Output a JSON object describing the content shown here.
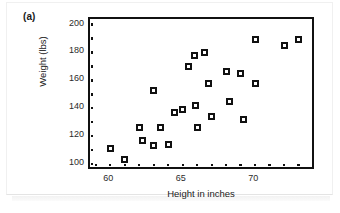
{
  "figure": {
    "panel_label": "(a)",
    "background_color": "#ffffff",
    "frame_color": "#111111",
    "marker_fill_color": "#ffffff",
    "marker_edge_color": "#111111"
  },
  "chart_data": {
    "type": "scatter",
    "title": "",
    "xlabel": "Height in inches",
    "ylabel": "Weight (lbs)",
    "xlim": [
      58.6,
      74.2
    ],
    "ylim": [
      95,
      204
    ],
    "xticks": [
      60,
      65,
      70
    ],
    "xtick_labels": [
      "60",
      "65",
      "70"
    ],
    "yticks": [
      100,
      120,
      140,
      160,
      180,
      200
    ],
    "ytick_labels": [
      "100",
      "120",
      "140",
      "160",
      "180",
      "200"
    ],
    "xminor_ticks": [
      59,
      60,
      61,
      62,
      63,
      64,
      65,
      66,
      67,
      68,
      69,
      70,
      71,
      72,
      73
    ],
    "yminor_ticks": [
      100,
      110,
      120,
      130,
      140,
      150,
      160,
      170,
      180,
      190,
      200
    ],
    "grid": false,
    "legend": null,
    "series": [
      {
        "name": "height-weight observations",
        "marker": "open-square",
        "points": [
          {
            "x": 60.0,
            "y": 111
          },
          {
            "x": 61.0,
            "y": 103
          },
          {
            "x": 62.0,
            "y": 126
          },
          {
            "x": 62.2,
            "y": 117
          },
          {
            "x": 63.0,
            "y": 153
          },
          {
            "x": 63.0,
            "y": 113
          },
          {
            "x": 63.5,
            "y": 126
          },
          {
            "x": 64.0,
            "y": 114
          },
          {
            "x": 64.4,
            "y": 137
          },
          {
            "x": 65.0,
            "y": 139
          },
          {
            "x": 65.4,
            "y": 170
          },
          {
            "x": 65.8,
            "y": 178
          },
          {
            "x": 65.9,
            "y": 142
          },
          {
            "x": 66.0,
            "y": 126
          },
          {
            "x": 66.5,
            "y": 180
          },
          {
            "x": 66.8,
            "y": 158
          },
          {
            "x": 67.0,
            "y": 134
          },
          {
            "x": 68.0,
            "y": 166
          },
          {
            "x": 68.2,
            "y": 145
          },
          {
            "x": 69.0,
            "y": 165
          },
          {
            "x": 69.2,
            "y": 132
          },
          {
            "x": 70.0,
            "y": 158
          },
          {
            "x": 70.0,
            "y": 189
          },
          {
            "x": 72.0,
            "y": 185
          },
          {
            "x": 73.0,
            "y": 189
          }
        ]
      }
    ]
  }
}
